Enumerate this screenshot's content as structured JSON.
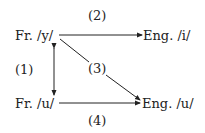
{
  "nodes": {
    "fr_y": "Fr. /y/",
    "eng_i": "Eng. /i/",
    "fr_u": "Fr. /u/",
    "eng_u": "Eng. /u/"
  },
  "edges": {
    "e1": "(1)",
    "e2": "(2)",
    "e3": "(3)",
    "e4": "(4)"
  },
  "colors": {
    "line": "#222222"
  }
}
